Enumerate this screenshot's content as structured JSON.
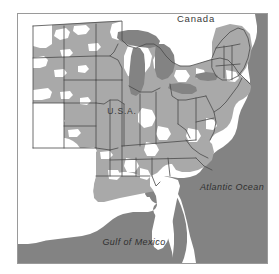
{
  "figure": {
    "kind": "thematic-distribution-map",
    "region": "Eastern and Central United States",
    "frame": {
      "x": 17,
      "y": 13,
      "width": 251,
      "height": 251,
      "border_color": "#9a9a9a"
    }
  },
  "colors": {
    "background": "#ffffff",
    "land_shaded": "#a9a9a9",
    "land_unshaded": "#ffffff",
    "water": "#838383",
    "lake": "#838383",
    "border_line": "#4a4a4a",
    "label_text": "#3a3a3a",
    "frame": "#9a9a9a"
  },
  "labels": [
    {
      "id": "canada",
      "text": "Canada",
      "x": 196,
      "y": 22,
      "style": "upright",
      "size": 9.5,
      "letter_spacing": 0.8
    },
    {
      "id": "usa",
      "text": "U.S.A.",
      "x": 122,
      "y": 114,
      "style": "upright",
      "size": 8.5,
      "letter_spacing": 0.8
    },
    {
      "id": "atlantic-ocean",
      "text": "Atlantic Ocean",
      "x": 232,
      "y": 190,
      "style": "italic",
      "size": 9,
      "letter_spacing": 0.4
    },
    {
      "id": "gulf-of-mexico",
      "text": "Gulf of Mexico",
      "x": 134,
      "y": 245,
      "style": "italic",
      "size": 9,
      "letter_spacing": 0.4
    }
  ],
  "legend_semantics": {
    "shaded_meaning": "present / within range",
    "unshaded_meaning": "absent / outside range"
  },
  "geography": {
    "water_bodies": [
      "Atlantic Ocean",
      "Gulf of Mexico",
      "Lake Superior",
      "Lake Michigan",
      "Lake Huron",
      "Lake Erie",
      "Lake Ontario"
    ],
    "shaded_states": [
      "Montana",
      "North Dakota",
      "South Dakota",
      "Minnesota",
      "Wisconsin",
      "Michigan",
      "Wyoming",
      "Nebraska",
      "Iowa",
      "Illinois",
      "Indiana",
      "Ohio",
      "Pennsylvania",
      "New York",
      "Vermont",
      "New Hampshire",
      "Maine",
      "Massachusetts",
      "Connecticut",
      "Rhode Island",
      "New Jersey",
      "Maryland",
      "Delaware",
      "West Virginia",
      "Virginia",
      "Kentucky",
      "Tennessee",
      "Missouri",
      "Kansas",
      "Arkansas",
      "Mississippi",
      "Alabama",
      "North Carolina",
      "South Carolina",
      "Georgia",
      "Louisiana",
      "Colorado"
    ],
    "unshaded_states": [
      "Texas",
      "Oklahoma",
      "New Mexico",
      "Florida",
      "Idaho",
      "Utah"
    ]
  }
}
